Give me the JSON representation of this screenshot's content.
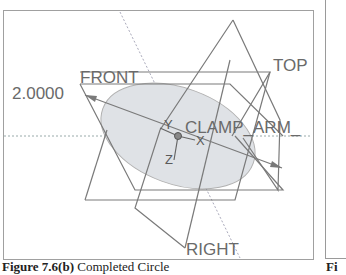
{
  "figure": {
    "dimension_value": "2.0000",
    "datum_planes": {
      "front": "FRONT",
      "top": "TOP",
      "right": "RIGHT"
    },
    "coordinate_system": {
      "name": "CLAMP_ARM_",
      "axes": {
        "x": "X",
        "y": "Y",
        "z": "Z"
      }
    },
    "colors": {
      "frame": "#a0a0a0",
      "lines": "#7a7a7a",
      "circle_fill": "#dfe2e6",
      "text": "#6a6a6a"
    }
  },
  "caption": {
    "label": "Figure 7.6(b)",
    "text": " Completed Circle",
    "next_label_fragment": "Fi"
  }
}
